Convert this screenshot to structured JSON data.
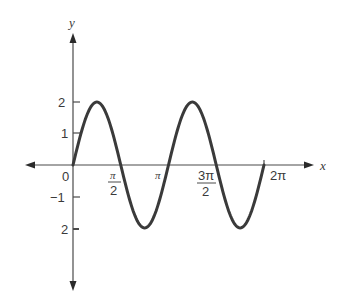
{
  "chart_data": {
    "type": "line",
    "title": "",
    "xlabel": "x",
    "ylabel": "y",
    "function": "y = 2 sin(2x)",
    "xlim": [
      0,
      6.2832
    ],
    "ylim": [
      -3.9,
      4.2
    ],
    "grid": false,
    "legend": null,
    "x_ticks": [
      {
        "value": 0,
        "label": "0"
      },
      {
        "value": 1.5708,
        "label_num": "π",
        "label_den": "2"
      },
      {
        "value": 3.1416,
        "label": "π"
      },
      {
        "value": 4.7124,
        "label_num": "3π",
        "label_den": "2"
      },
      {
        "value": 6.2832,
        "label": "2π"
      }
    ],
    "y_ticks": [
      {
        "value": 2,
        "label": "2"
      },
      {
        "value": 1,
        "label": "1"
      },
      {
        "value": -1,
        "label": "−1"
      },
      {
        "value": -2,
        "label": "2"
      }
    ],
    "series": [
      {
        "name": "2 sin 2x",
        "color": "#3a3a3a",
        "x": [
          0,
          0.3927,
          0.7854,
          1.1781,
          1.5708,
          1.9635,
          2.3562,
          2.7489,
          3.1416,
          3.5343,
          3.927,
          4.3197,
          4.7124,
          5.1051,
          5.4978,
          5.8905,
          6.2832
        ],
        "y": [
          0,
          1.414,
          2,
          1.414,
          0,
          -1.414,
          -2,
          -1.414,
          0,
          1.414,
          2,
          1.414,
          0,
          -1.414,
          -2,
          -1.414,
          0
        ]
      }
    ]
  },
  "labels": {
    "y_axis": "y",
    "x_axis": "x",
    "origin": "0",
    "tick_2": "2",
    "tick_1": "1",
    "tick_m1": "−1",
    "tick_m2": "2",
    "pi_half_num": "π",
    "pi_half_den": "2",
    "pi": "π",
    "three_pi_half_num": "3π",
    "three_pi_half_den": "2",
    "two_pi": "2π"
  }
}
